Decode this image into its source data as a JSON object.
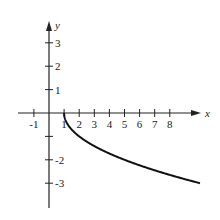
{
  "chart_data": {
    "type": "line",
    "title": "",
    "xlabel": "x",
    "ylabel": "y",
    "xlim": [
      -2,
      10
    ],
    "ylim": [
      -4,
      4
    ],
    "grid": false,
    "x_ticks": [
      -1,
      1,
      2,
      3,
      4,
      5,
      6,
      7,
      8
    ],
    "x_tick_labels": [
      "-1",
      "1",
      "2",
      "3",
      "4",
      "5",
      "6",
      "7",
      "8"
    ],
    "y_ticks": [
      3,
      2,
      1,
      -1,
      -2,
      -3
    ],
    "y_tick_labels": [
      "3",
      "2",
      "1",
      "",
      "-2",
      "-3"
    ],
    "series": [
      {
        "name": "y = -sqrt(x - 1)",
        "x": [
          1,
          1.25,
          1.5,
          2,
          3,
          4,
          5,
          6,
          7,
          8,
          9,
          10
        ],
        "values": [
          0,
          -0.5,
          -0.71,
          -1,
          -1.41,
          -1.73,
          -2,
          -2.24,
          -2.45,
          -2.65,
          -2.83,
          -3
        ]
      }
    ],
    "colors": {
      "axis": "#222222",
      "curve": "#111111"
    }
  }
}
